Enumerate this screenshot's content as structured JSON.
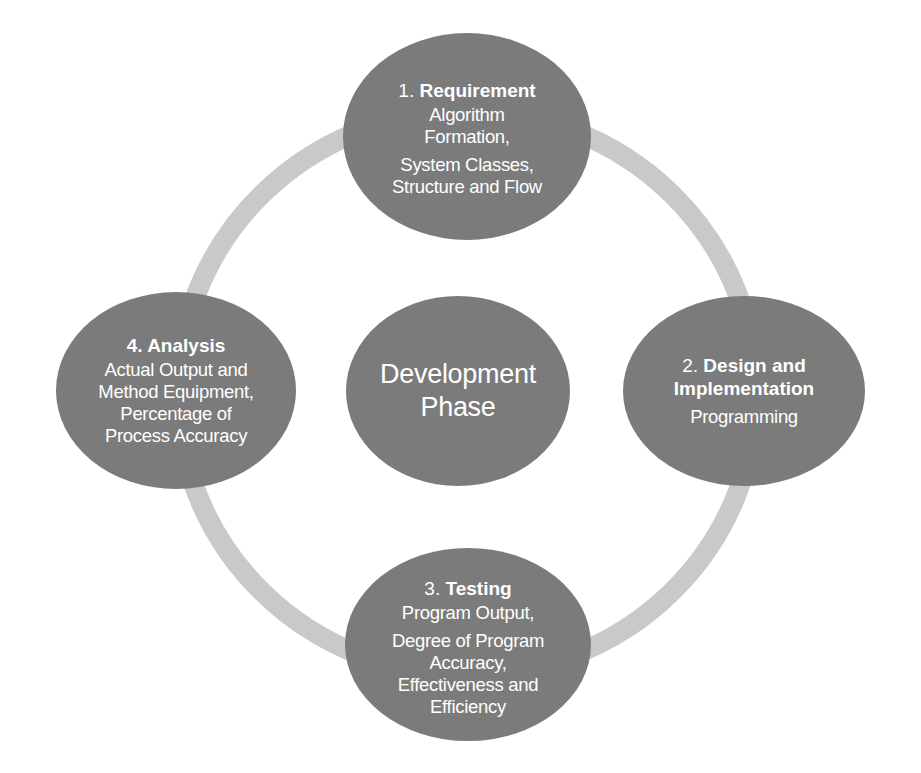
{
  "diagram": {
    "type": "cycle",
    "colors": {
      "node_fill": "#7b7b7b",
      "ring": "#c9c9c9",
      "text": "#ffffff",
      "background": "#ffffff"
    },
    "center": {
      "lines": [
        "Development",
        "Phase"
      ]
    },
    "nodes": [
      {
        "id": "requirement",
        "number": "1.",
        "title": "Requirement",
        "groups": [
          [
            "Algorithm",
            "Formation,"
          ],
          [
            "System Classes,",
            "Structure and Flow"
          ]
        ]
      },
      {
        "id": "design",
        "number": "2.",
        "title_lines": [
          "Design and",
          "Implementation"
        ],
        "groups": [
          [
            "Programming"
          ]
        ]
      },
      {
        "id": "testing",
        "number": "3.",
        "title": "Testing",
        "groups": [
          [
            "Program Output,"
          ],
          [
            "Degree of Program",
            "Accuracy,",
            "Effectiveness and",
            "Efficiency"
          ]
        ]
      },
      {
        "id": "analysis",
        "number": "4.",
        "title": "Analysis",
        "groups": [
          [
            "Actual Output and",
            "Method Equipment,",
            "Percentage of",
            "Process Accuracy"
          ]
        ]
      }
    ]
  }
}
